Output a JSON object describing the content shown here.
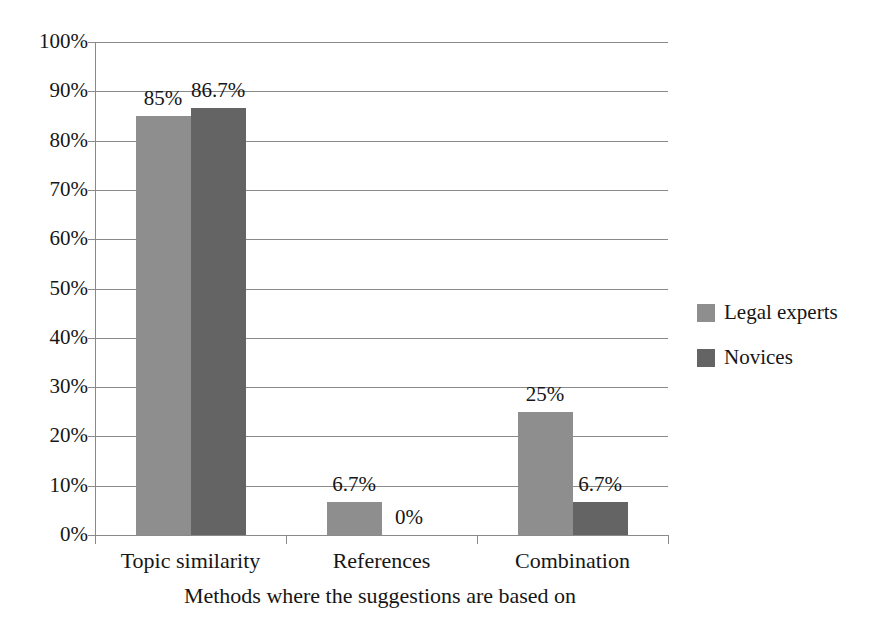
{
  "chart_data": {
    "type": "bar",
    "title": "",
    "xlabel": "Methods where the suggestions are based on",
    "ylabel": "",
    "categories": [
      "Topic similarity",
      "References",
      "Combination"
    ],
    "series": [
      {
        "name": "Legal experts",
        "color": "#8e8e8e",
        "values": [
          85,
          6.7,
          25
        ],
        "labels": [
          "85%",
          "6.7%",
          "25%"
        ]
      },
      {
        "name": "Novices",
        "color": "#646464",
        "values": [
          86.7,
          0,
          6.7
        ],
        "labels": [
          "86.7%",
          "0%",
          "6.7%"
        ]
      }
    ],
    "ylim": [
      0,
      100
    ],
    "yticks": [
      0,
      10,
      20,
      30,
      40,
      50,
      60,
      70,
      80,
      90,
      100
    ],
    "ytick_labels": [
      "0%",
      "10%",
      "20%",
      "30%",
      "40%",
      "50%",
      "60%",
      "70%",
      "80%",
      "90%",
      "100%"
    ],
    "grid": true,
    "legend_position": "right"
  },
  "legend": {
    "items": [
      {
        "label": "Legal experts",
        "color": "#8e8e8e"
      },
      {
        "label": "Novices",
        "color": "#646464"
      }
    ]
  },
  "axis": {
    "x_title": "Methods where the suggestions are based on"
  }
}
